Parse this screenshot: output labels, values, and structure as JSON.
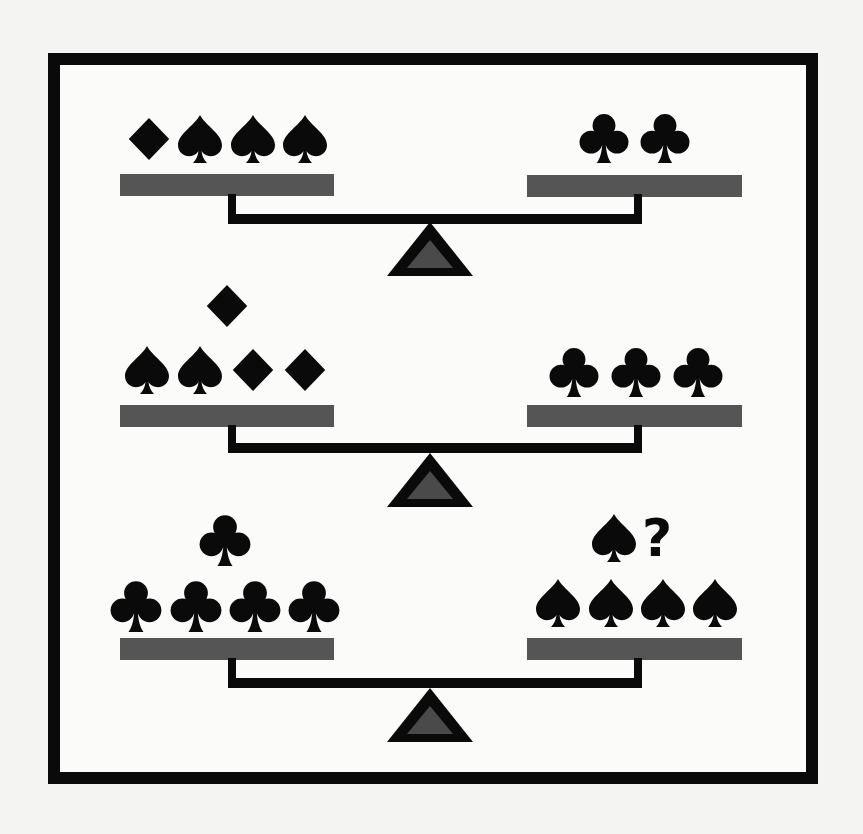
{
  "puzzle": {
    "type": "balance-scale puzzle",
    "colors": {
      "frame": "#0a0a0a",
      "pan": "#555555",
      "beam": "#0a0a0a",
      "pivot_outline": "#0a0a0a",
      "pivot_fill": "#4a4a4a",
      "symbol": "#0a0a0a",
      "background": "#fbfbf9"
    },
    "scales": [
      {
        "id": "scale-1",
        "left_pan": {
          "items": [
            "diamond",
            "spade",
            "spade",
            "spade"
          ]
        },
        "right_pan": {
          "items": [
            "club",
            "club"
          ]
        },
        "state": "balanced"
      },
      {
        "id": "scale-2",
        "left_pan": {
          "items": [
            "spade",
            "spade",
            "diamond",
            "diamond",
            "diamond"
          ]
        },
        "right_pan": {
          "items": [
            "club",
            "club",
            "club"
          ]
        },
        "state": "balanced"
      },
      {
        "id": "scale-3",
        "left_pan": {
          "items": [
            "club",
            "club",
            "club",
            "club",
            "club"
          ]
        },
        "right_pan": {
          "items": [
            "spade",
            "spade",
            "spade",
            "spade",
            "spade",
            "?"
          ]
        },
        "state": "balanced"
      }
    ],
    "question_mark": "?"
  }
}
